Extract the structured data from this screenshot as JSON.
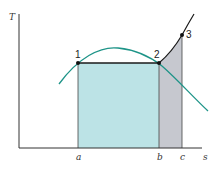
{
  "diagram": {
    "axes": {
      "y_label": "T",
      "x_label": "s"
    },
    "x_ticks": [
      "a",
      "b",
      "c"
    ],
    "states": [
      {
        "id": "1",
        "label": "1"
      },
      {
        "id": "2",
        "label": "2"
      },
      {
        "id": "3",
        "label": "3"
      }
    ],
    "regions": [
      {
        "name": "area-1-2-b-a",
        "color": "#BCE3E6"
      },
      {
        "name": "area-2-3-c-b",
        "color": "#C6C8CF"
      }
    ],
    "colors": {
      "saturation_dome": "#1E9488",
      "process_line": "#1A1A1A",
      "axis": "#333333",
      "fill_teal": "#BCE3E6",
      "fill_gray": "#C6C8CF"
    }
  }
}
